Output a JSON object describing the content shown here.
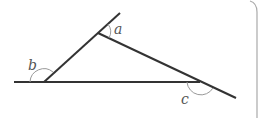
{
  "diagram": {
    "type": "triangle-exterior-angles",
    "colors": {
      "line": "#333333",
      "arc": "#999999",
      "label": "#555555",
      "border": "#aaaaaa"
    },
    "labels": {
      "a": "a",
      "b": "b",
      "c": "c"
    },
    "points": {
      "baseline_start": [
        14,
        82
      ],
      "vertex_left": [
        44,
        82
      ],
      "vertex_top": [
        98,
        33
      ],
      "top_extension_end": [
        120,
        13
      ],
      "vertex_right": [
        200,
        82
      ],
      "right_extension_end": [
        236,
        98
      ]
    }
  }
}
